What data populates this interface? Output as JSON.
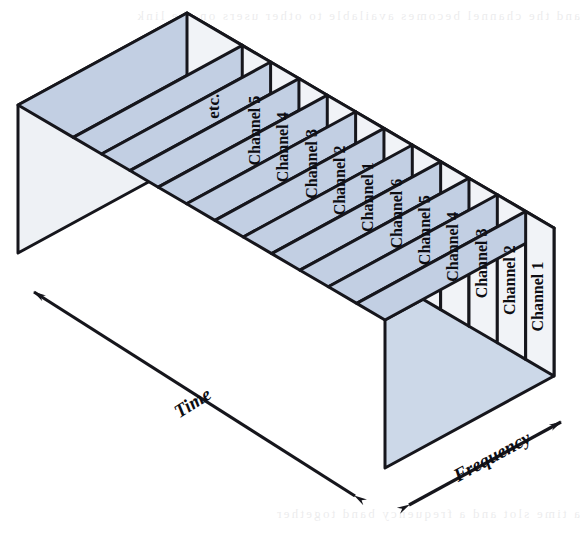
{
  "figure": {
    "kind": "3d-block-diagram",
    "axes": {
      "time": {
        "label": "Time",
        "arrow": "double-headed",
        "direction": "lower-right to upper-left"
      },
      "frequency": {
        "label": "Frequency",
        "arrow": "double-headed",
        "direction": "lower-left to upper-right"
      }
    },
    "slices": [
      {
        "label": "etc."
      },
      {
        "label": "Channel 5"
      },
      {
        "label": "Channel 4"
      },
      {
        "label": "Channel 3"
      },
      {
        "label": "Channel 2"
      },
      {
        "label": "Channel 1"
      },
      {
        "label": "Channel 6"
      },
      {
        "label": "Channel 5"
      },
      {
        "label": "Channel 4"
      },
      {
        "label": "Channel 3"
      },
      {
        "label": "Channel 2"
      },
      {
        "label": "Channel 1"
      }
    ],
    "colors": {
      "top_face": "#c2cfe3",
      "end_face": "#ccd8e8",
      "front_face": "#f1f3f7",
      "left_face": "#eef1f5",
      "outline": "#16161c",
      "label_text": "#0d0d12"
    },
    "scan_artifacts": {
      "top_bleed": "and the channel becomes available to other users on the link",
      "bottom_bleed": "a time slot and a frequency band together"
    }
  }
}
